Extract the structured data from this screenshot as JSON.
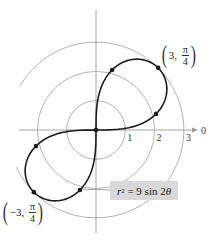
{
  "chart_data": {
    "type": "line",
    "subtype": "polar",
    "title": "",
    "equation": "r^2 = 9 sin 2θ",
    "equation_parts": {
      "lhs_var": "r",
      "lhs_exp": "2",
      "rhs": " = 9 sin 2",
      "rhs_var": "θ"
    },
    "polar_axis_label": "0",
    "radial_ticks": [
      "1",
      "2",
      "3"
    ],
    "radial_grid": [
      1,
      2,
      3
    ],
    "grid": true,
    "curve": "lemniscate",
    "r_squared_coefficient": 9,
    "marked_points": [
      {
        "r": 2.121,
        "theta_deg": 15
      },
      {
        "r": 3,
        "theta_deg": 45
      },
      {
        "r": 2.121,
        "theta_deg": 75
      },
      {
        "r": -2.121,
        "theta_deg": 15
      },
      {
        "r": -3,
        "theta_deg": 45
      },
      {
        "r": -2.121,
        "theta_deg": 75
      },
      {
        "r": 0,
        "theta_deg": 0
      }
    ],
    "annotations": [
      {
        "text": "(3, π/4)",
        "r": "3",
        "theta_num": "π",
        "theta_den": "4"
      },
      {
        "text": "(−3, π/4)",
        "r": "−3",
        "theta_num": "π",
        "theta_den": "4"
      }
    ]
  },
  "geometry": {
    "cx": 96,
    "cy": 130,
    "unit": 29.3
  },
  "colors": {
    "curve": "#1a1a1a",
    "grid": "#a9a9a9",
    "label_box": "#d9d9d9"
  }
}
